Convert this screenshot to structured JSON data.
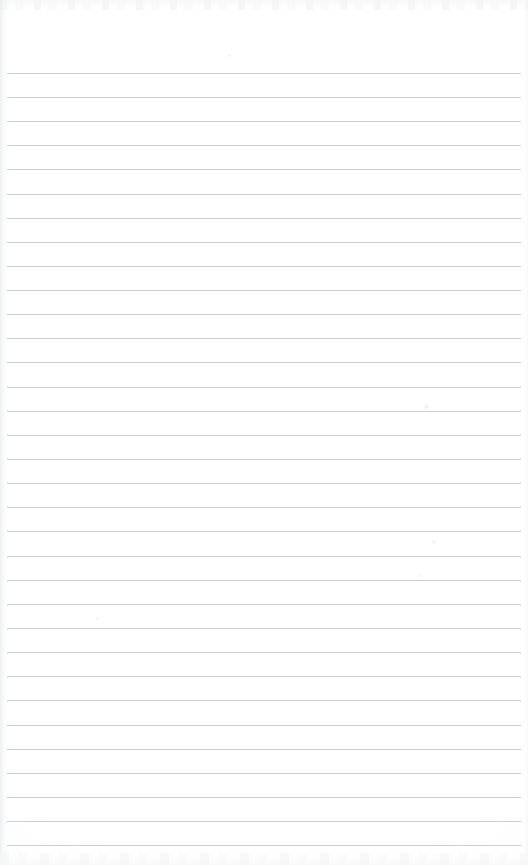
{
  "document": {
    "kind": "lined-notepad-page",
    "title": "",
    "content_text": "",
    "is_blank": true,
    "page_width": 528,
    "page_height": 865
  },
  "paper": {
    "background_color": "#ffffff",
    "rule_color": "#c9cdd2",
    "edge_shade_color": "#e1e4e8",
    "rule_thickness_px": 1,
    "rule_spacing_px": 24.1,
    "first_rule_y": 73,
    "rule_left_x": 7,
    "rule_right_x": 521,
    "rule_count": 33
  },
  "header_zone": {
    "label": "",
    "height_px": 73
  },
  "rules": [
    {
      "index": 1,
      "y": 73,
      "text": ""
    },
    {
      "index": 2,
      "y": 97,
      "text": ""
    },
    {
      "index": 3,
      "y": 121,
      "text": ""
    },
    {
      "index": 4,
      "y": 145,
      "text": ""
    },
    {
      "index": 5,
      "y": 169,
      "text": ""
    },
    {
      "index": 6,
      "y": 194,
      "text": ""
    },
    {
      "index": 7,
      "y": 218,
      "text": ""
    },
    {
      "index": 8,
      "y": 242,
      "text": ""
    },
    {
      "index": 9,
      "y": 266,
      "text": ""
    },
    {
      "index": 10,
      "y": 290,
      "text": ""
    },
    {
      "index": 11,
      "y": 314,
      "text": ""
    },
    {
      "index": 12,
      "y": 338,
      "text": ""
    },
    {
      "index": 13,
      "y": 362,
      "text": ""
    },
    {
      "index": 14,
      "y": 387,
      "text": ""
    },
    {
      "index": 15,
      "y": 411,
      "text": ""
    },
    {
      "index": 16,
      "y": 435,
      "text": ""
    },
    {
      "index": 17,
      "y": 459,
      "text": ""
    },
    {
      "index": 18,
      "y": 483,
      "text": ""
    },
    {
      "index": 19,
      "y": 507,
      "text": ""
    },
    {
      "index": 20,
      "y": 531,
      "text": ""
    },
    {
      "index": 21,
      "y": 556,
      "text": ""
    },
    {
      "index": 22,
      "y": 580,
      "text": ""
    },
    {
      "index": 23,
      "y": 604,
      "text": ""
    },
    {
      "index": 24,
      "y": 628,
      "text": ""
    },
    {
      "index": 25,
      "y": 652,
      "text": ""
    },
    {
      "index": 26,
      "y": 676,
      "text": ""
    },
    {
      "index": 27,
      "y": 700,
      "text": ""
    },
    {
      "index": 28,
      "y": 725,
      "text": ""
    },
    {
      "index": 29,
      "y": 749,
      "text": ""
    },
    {
      "index": 30,
      "y": 773,
      "text": ""
    },
    {
      "index": 31,
      "y": 797,
      "text": ""
    },
    {
      "index": 32,
      "y": 821,
      "text": ""
    },
    {
      "index": 33,
      "y": 845,
      "text": ""
    }
  ],
  "specks": [
    {
      "x": 424,
      "y": 404,
      "size": 5
    },
    {
      "x": 432,
      "y": 540,
      "size": 4
    },
    {
      "x": 419,
      "y": 574,
      "size": 3
    },
    {
      "x": 228,
      "y": 54,
      "size": 3
    },
    {
      "x": 96,
      "y": 617,
      "size": 3
    }
  ]
}
